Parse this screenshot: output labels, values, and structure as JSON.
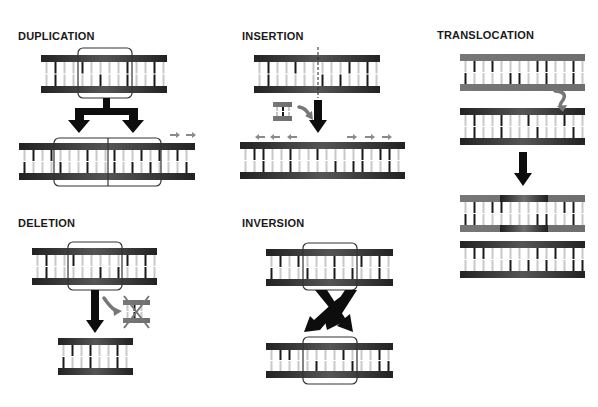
{
  "panels": {
    "duplication": {
      "title": "DUPLICATION"
    },
    "insertion": {
      "title": "INSERTION"
    },
    "translocation": {
      "title": "TRANSLOCATION"
    },
    "deletion": {
      "title": "DELETION"
    },
    "inversion": {
      "title": "INVERSION"
    }
  },
  "colors": {
    "strand_dark": "#2b2b2b",
    "strand_mid": "#6a6a6a",
    "strand_gray": "#7a7a7a",
    "rung_dark": "#1a1a1a",
    "rung_light": "#c8c8c8",
    "arrow": "#0d0d0d",
    "small_arrow": "#8a8a8a",
    "box_outline": "#333333"
  }
}
